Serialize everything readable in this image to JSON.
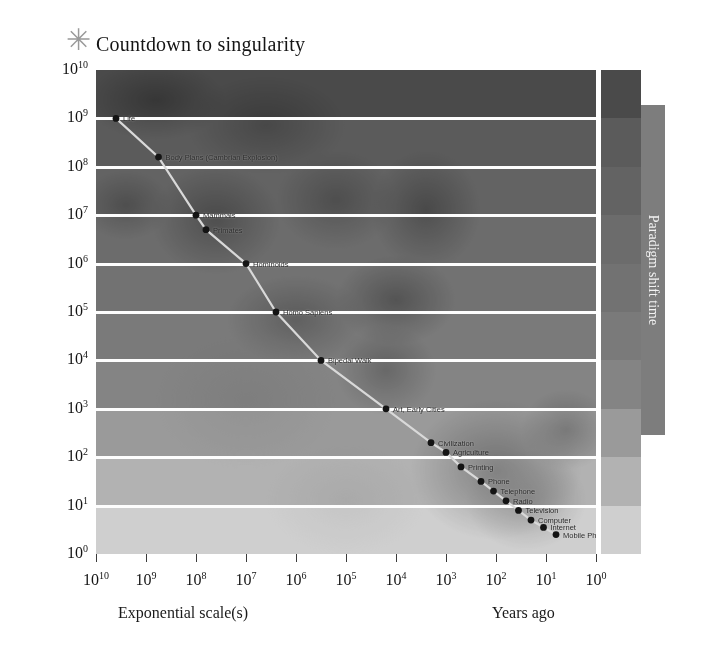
{
  "chart_data": {
    "type": "scatter",
    "title": "Countdown to singularity",
    "xlabel": "Exponential scale(s)",
    "xlabel_right": "Years ago",
    "ylabel": "",
    "legend_label": "Paradigm shift time",
    "x_tick_labels": [
      "10",
      "10",
      "10",
      "10",
      "10",
      "10",
      "10",
      "10",
      "10",
      "10",
      "10"
    ],
    "x_tick_exponents": [
      "10",
      "9",
      "8",
      "7",
      "6",
      "5",
      "4",
      "3",
      "2",
      "1",
      "0"
    ],
    "y_tick_labels": [
      "10",
      "10",
      "10",
      "10",
      "10",
      "10",
      "10",
      "10",
      "10",
      "10",
      "10"
    ],
    "y_tick_exponents": [
      "10",
      "9",
      "8",
      "7",
      "6",
      "5",
      "4",
      "3",
      "2",
      "1",
      "0"
    ],
    "xlim_log": [
      10,
      0
    ],
    "ylim_log": [
      0,
      10
    ],
    "x_axis_scale": "log (years ago, descending)",
    "y_axis_scale": "log (paradigm shift time, seconds)",
    "grid": true,
    "legend_position": "right",
    "points": [
      {
        "label": "Life",
        "x_log": 9.6,
        "y_log": 9.0
      },
      {
        "label": "Body Plans (Cambrian Explosion)",
        "x_log": 8.75,
        "y_log": 8.2
      },
      {
        "label": "Mammals",
        "x_log": 8.0,
        "y_log": 7.0
      },
      {
        "label": "Primates",
        "x_log": 7.8,
        "y_log": 6.7
      },
      {
        "label": "Hominoids",
        "x_log": 7.0,
        "y_log": 6.0
      },
      {
        "label": "Homo Sapiens",
        "x_log": 6.4,
        "y_log": 5.0
      },
      {
        "label": "Bipedal Walk",
        "x_log": 5.5,
        "y_log": 4.0
      },
      {
        "label": "Art, Early Cities",
        "x_log": 4.2,
        "y_log": 3.0
      },
      {
        "label": "Civilization",
        "x_log": 3.3,
        "y_log": 2.3
      },
      {
        "label": "Agriculture",
        "x_log": 3.0,
        "y_log": 2.1
      },
      {
        "label": "Printing",
        "x_log": 2.7,
        "y_log": 1.8
      },
      {
        "label": "Phone",
        "x_log": 2.3,
        "y_log": 1.5
      },
      {
        "label": "Telephone",
        "x_log": 2.05,
        "y_log": 1.3
      },
      {
        "label": "Radio",
        "x_log": 1.8,
        "y_log": 1.1
      },
      {
        "label": "Television",
        "x_log": 1.55,
        "y_log": 0.9
      },
      {
        "label": "Computer",
        "x_log": 1.3,
        "y_log": 0.7
      },
      {
        "label": "Internet",
        "x_log": 1.05,
        "y_log": 0.55
      },
      {
        "label": "Mobile Phones",
        "x_log": 0.8,
        "y_log": 0.4
      }
    ],
    "band_colors": [
      "#4a4a4a",
      "#5b5b5b",
      "#636363",
      "#6c6c6c",
      "#727272",
      "#7a7a7a",
      "#848484",
      "#9a9a9a",
      "#b2b2b2",
      "#cfcfcf",
      "#ececec"
    ]
  },
  "icons": {
    "asterisk": "✳"
  }
}
